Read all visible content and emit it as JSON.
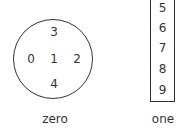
{
  "diagram": {
    "circle_group": {
      "label": "zero",
      "items": [
        {
          "value": "3",
          "position": "top"
        },
        {
          "value": "0",
          "position": "left"
        },
        {
          "value": "1",
          "position": "center"
        },
        {
          "value": "2",
          "position": "right"
        },
        {
          "value": "4",
          "position": "bottom"
        }
      ]
    },
    "box_group": {
      "label": "one",
      "items": [
        "5",
        "6",
        "7",
        "8",
        "9"
      ]
    },
    "stroke_color": "#333333"
  }
}
